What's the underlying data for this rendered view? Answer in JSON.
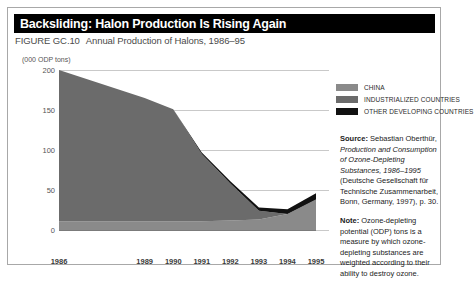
{
  "figure": {
    "title": "Backsliding: Halon Production Is Rising Again",
    "caption_id": "FIGURE GC.10",
    "caption_text": "Annual Production of Halons, 1986–95"
  },
  "legend": {
    "items": [
      {
        "label": "CHINA",
        "color": "#8a8a8a"
      },
      {
        "label": "INDUSTRIALIZED COUNTRIES",
        "color": "#6b6b6b"
      },
      {
        "label": "OTHER DEVELOPING COUNTRIES",
        "color": "#111111"
      }
    ]
  },
  "source": {
    "lead_in": "Source:",
    "part1": " Sebastian Oberthür, ",
    "italic1": "Production and Consumption of Ozone-Depleting Substances, 1986–1995",
    "part2": " (Deutsche Gesellschaft für Technische Zusammenarbeit, Bonn, Germany, 1997), p. 30."
  },
  "note": {
    "lead_in": "Note:",
    "text": " Ozone-depleting potential (ODP) tons is a measure by which ozone-depleting substances are weighted according to their ability to destroy ozone."
  },
  "chart_data": {
    "type": "area",
    "title": "Annual Production of Halons, 1986–95",
    "xlabel": "",
    "ylabel": "(000 ODP tons)",
    "yunit_label": "(000 ODP tons)",
    "ylim": [
      0,
      200
    ],
    "yticks": [
      0,
      50,
      100,
      150,
      200
    ],
    "grid": true,
    "legend_position": "right",
    "stacked": true,
    "x": [
      1986,
      1989,
      1990,
      1991,
      1992,
      1993,
      1994,
      1995
    ],
    "categories": [
      "1986",
      "1989",
      "1990",
      "1991",
      "1992",
      "1993",
      "1994",
      "1995"
    ],
    "series": [
      {
        "name": "CHINA",
        "color": "#8a8a8a",
        "values": [
          11,
          11,
          11,
          11,
          12,
          13,
          20,
          38
        ]
      },
      {
        "name": "INDUSTRIALIZED COUNTRIES",
        "color": "#6b6b6b",
        "values": [
          189,
          154,
          140,
          84,
          46,
          11,
          0,
          0
        ]
      },
      {
        "name": "OTHER DEVELOPING COUNTRIES",
        "color": "#111111",
        "values": [
          0,
          0,
          0,
          2,
          3,
          4,
          6,
          8
        ]
      }
    ],
    "totals": [
      200,
      165,
      151,
      97,
      61,
      28,
      26,
      46
    ]
  }
}
